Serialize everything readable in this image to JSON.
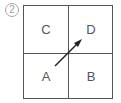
{
  "figure": {
    "number_label": "2",
    "cells": [
      {
        "id": "top-left",
        "label": "C"
      },
      {
        "id": "top-right",
        "label": "D"
      },
      {
        "id": "bottom-left",
        "label": "A"
      },
      {
        "id": "bottom-right",
        "label": "B"
      }
    ],
    "arrow": {
      "from": "A",
      "to": "D",
      "direction": "up-right"
    },
    "colors": {
      "line": "#555555",
      "number": "#a0a0a0"
    }
  }
}
